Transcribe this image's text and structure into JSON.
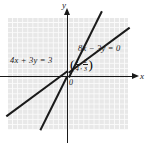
{
  "figure": {
    "type": "coordinate-graph",
    "background_color": "#ffffff",
    "grid_color": "#e8e8e8",
    "gridline_color": "#fbfbfb",
    "ink_color": "#1a1a1a"
  },
  "axes": {
    "x_label": "x",
    "y_label": "y",
    "origin_label": "0"
  },
  "annotations": {
    "equation_right": "8x − 3y = 0",
    "equation_left": "4x + 3y = 3"
  },
  "intersection_point": {
    "open_paren": "(",
    "x_numerator": "1",
    "x_denominator": "4",
    "separator": ",",
    "y_numerator": "2",
    "y_denominator": "3",
    "close_paren": ")"
  },
  "chart_data": {
    "type": "line",
    "title": "",
    "xlabel": "x",
    "ylabel": "y",
    "grid": true,
    "legend": "inline-annotations",
    "xlim": [
      -6,
      6
    ],
    "ylim": [
      -5.5,
      5.5
    ],
    "series": [
      {
        "name": "8x − 3y = 0",
        "equation": "8x - 3y = 0",
        "slope": 2.6667,
        "intercept": 0,
        "points": [
          [
            -2.2,
            -5.87
          ],
          [
            2.2,
            5.87
          ]
        ]
      },
      {
        "name": "4x + 3y = 3",
        "equation": "4x + 3y = 3",
        "slope": -1.3333,
        "intercept": 1,
        "points": [
          [
            -5.0,
            7.67
          ],
          [
            5.5,
            -6.33
          ]
        ]
      }
    ],
    "annotations": [
      {
        "text": "8x − 3y = 0",
        "x": 1.6,
        "y": 3.5
      },
      {
        "text": "4x + 3y = 3",
        "x": -5.0,
        "y": 2.2
      },
      {
        "text": "(1/4, 2/3)",
        "x": 0.6,
        "y": 1.5
      },
      {
        "text": "0",
        "x": 0.2,
        "y": -0.4
      }
    ],
    "intersection": {
      "x": 0.25,
      "y": 0.6667
    }
  }
}
